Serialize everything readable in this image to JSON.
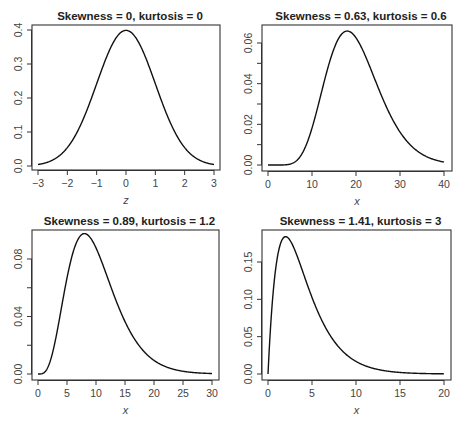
{
  "chart_data": [
    {
      "type": "line",
      "title": "Skewness = 0, kurtosis = 0",
      "xlabel": "z",
      "ylabel": "",
      "distribution": "standard normal",
      "xlim": [
        -3,
        3
      ],
      "ylim": [
        0,
        0.4
      ],
      "xticks": [
        "-3",
        "-2",
        "-1",
        "0",
        "1",
        "2",
        "3"
      ],
      "yticks": [
        "0.0",
        "0.1",
        "0.2",
        "0.3",
        "0.4"
      ],
      "x": [
        -3,
        -2,
        -1,
        0,
        1,
        2,
        3
      ],
      "y": [
        0.004,
        0.054,
        0.242,
        0.399,
        0.242,
        0.054,
        0.004
      ],
      "peak": {
        "x": 0,
        "y": 0.399
      },
      "grid": false
    },
    {
      "type": "line",
      "title": "Skewness = 0.63, kurtosis = 0.6",
      "xlabel": "x",
      "ylabel": "",
      "distribution": "chi-square, df = 20",
      "xlim": [
        0,
        40
      ],
      "ylim": [
        0,
        0.066
      ],
      "xticks": [
        "0",
        "10",
        "20",
        "30",
        "40"
      ],
      "yticks": [
        "0.00",
        "0.02",
        "0.04",
        "0.06"
      ],
      "x": [
        0,
        5,
        10,
        15,
        18,
        20,
        25,
        30,
        35,
        40
      ],
      "y": [
        0.0,
        0.0003,
        0.0189,
        0.0557,
        0.0658,
        0.0626,
        0.0431,
        0.0185,
        0.0062,
        0.0017
      ],
      "peak": {
        "x": 18,
        "y": 0.066
      },
      "grid": false
    },
    {
      "type": "line",
      "title": "Skewness = 0.89, kurtosis = 1.2",
      "xlabel": "x",
      "ylabel": "",
      "distribution": "chi-square, df = 10",
      "xlim": [
        0,
        30
      ],
      "ylim": [
        0,
        0.098
      ],
      "xticks": [
        "0",
        "5",
        "10",
        "15",
        "20",
        "25",
        "30"
      ],
      "yticks": [
        "0.00",
        "0.04",
        "0.08"
      ],
      "x": [
        0,
        2,
        5,
        8,
        10,
        15,
        20,
        25,
        30
      ],
      "y": [
        0.0,
        0.0153,
        0.0668,
        0.0977,
        0.0877,
        0.0385,
        0.0095,
        0.0018,
        0.0003
      ],
      "peak": {
        "x": 8,
        "y": 0.098
      },
      "grid": false
    },
    {
      "type": "line",
      "title": "Skewness = 1.41, kurtosis = 3",
      "xlabel": "x",
      "ylabel": "",
      "distribution": "chi-square, df = 4",
      "xlim": [
        0,
        20
      ],
      "ylim": [
        0,
        0.184
      ],
      "xticks": [
        "0",
        "5",
        "10",
        "15",
        "20"
      ],
      "yticks": [
        "0.00",
        "0.05",
        "0.10",
        "0.15"
      ],
      "x": [
        0,
        1,
        2,
        3,
        5,
        7.5,
        10,
        15,
        20
      ],
      "y": [
        0.0,
        0.1516,
        0.1839,
        0.1673,
        0.1026,
        0.0443,
        0.0168,
        0.0021,
        0.0002
      ],
      "peak": {
        "x": 2,
        "y": 0.184
      },
      "grid": false
    }
  ],
  "panels": [
    {
      "title": "Skewness = 0, kurtosis = 0",
      "xlabel": "z",
      "dist": "normal",
      "df": 0,
      "xmin": -3,
      "xmax": 3,
      "ymin": 0,
      "ymax": 0.4,
      "xticks": [
        -3,
        -2,
        -1,
        0,
        1,
        2,
        3
      ],
      "xtick_labels": [
        "−3",
        "−2",
        "−1",
        "0",
        "1",
        "2",
        "3"
      ],
      "yticks": [
        0,
        0.1,
        0.2,
        0.3,
        0.4
      ],
      "ytick_labels": [
        "0.0",
        "0.1",
        "0.2",
        "0.3",
        "0.4"
      ],
      "minor_yticks": [],
      "box": [
        32,
        25,
        220,
        170
      ],
      "px_x": [
        38,
        214
      ],
      "px_y": [
        166,
        30
      ]
    },
    {
      "title": "Skewness = 0.63, kurtosis = 0.6",
      "xlabel": "x",
      "dist": "chisq",
      "df": 20,
      "xmin": 0,
      "xmax": 40,
      "ymin": 0,
      "ymax": 0.06,
      "xticks": [
        0,
        10,
        20,
        30,
        40
      ],
      "xtick_labels": [
        "0",
        "10",
        "20",
        "30",
        "40"
      ],
      "yticks": [
        0,
        0.02,
        0.04,
        0.06
      ],
      "ytick_labels": [
        "0.00",
        "0.02",
        "0.04",
        "0.06"
      ],
      "minor_yticks": [
        0.01,
        0.03,
        0.05
      ],
      "box": [
        262,
        25,
        452,
        171
      ],
      "px_x": [
        268,
        444
      ],
      "px_y": [
        165,
        43
      ]
    },
    {
      "title": "Skewness = 0.89, kurtosis = 1.2",
      "xlabel": "x",
      "dist": "chisq",
      "df": 10,
      "xmin": 0,
      "xmax": 30,
      "ymin": 0,
      "ymax": 0.08,
      "xticks": [
        0,
        5,
        10,
        15,
        20,
        25,
        30
      ],
      "xtick_labels": [
        "0",
        "5",
        "10",
        "15",
        "20",
        "25",
        "30"
      ],
      "yticks": [
        0,
        0.04,
        0.08
      ],
      "ytick_labels": [
        "0.00",
        "0.04",
        "0.08"
      ],
      "minor_yticks": [
        0.02,
        0.06
      ],
      "box": [
        32,
        230,
        219,
        380
      ],
      "px_x": [
        38,
        212
      ],
      "px_y": [
        374,
        259
      ]
    },
    {
      "title": "Skewness = 1.41, kurtosis = 3",
      "xlabel": "x",
      "dist": "chisq",
      "df": 4,
      "xmin": 0,
      "xmax": 20,
      "ymin": 0,
      "ymax": 0.15,
      "xticks": [
        0,
        5,
        10,
        15,
        20
      ],
      "xtick_labels": [
        "0",
        "5",
        "10",
        "15",
        "20"
      ],
      "yticks": [
        0,
        0.05,
        0.1,
        0.15
      ],
      "ytick_labels": [
        "0.00",
        "0.05",
        "0.10",
        "0.15"
      ],
      "minor_yticks": [],
      "box": [
        262,
        230,
        451,
        380
      ],
      "px_x": [
        268,
        444
      ],
      "px_y": [
        374,
        262
      ]
    }
  ],
  "style": {
    "line_color": "#111111",
    "axis_color": "#333333",
    "text_color": "#444444",
    "background": "#ffffff"
  }
}
